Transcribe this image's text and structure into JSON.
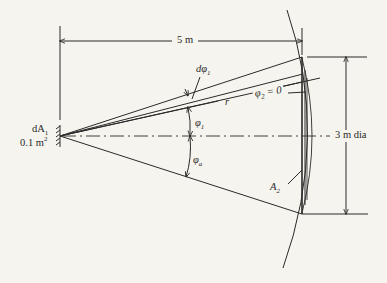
{
  "figure": {
    "type": "geometric view-factor diagram",
    "labels": {
      "distance": "5 m",
      "diameter": "3 m dia",
      "source_area_name": "dA",
      "source_area_sub": "1",
      "source_area_value": "0.1 m",
      "source_area_value_sup": "2",
      "d_phi1": "dφ",
      "d_phi1_sub": "1",
      "r": "r",
      "phi2_eq": "φ",
      "phi2_sub": "2",
      "phi2_rest": " = 0",
      "phi1": "φ",
      "phi1_sub": "1",
      "phi_a": "φ",
      "phi_a_sub": "a",
      "target_area": "A",
      "target_area_sub": "2"
    },
    "colors": {
      "line": "#2a2a2a",
      "background": "#f6f4ee"
    }
  }
}
